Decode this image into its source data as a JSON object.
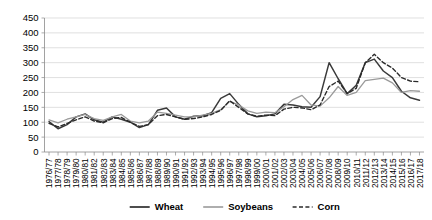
{
  "chart_data": {
    "type": "line",
    "title": "",
    "subtitle": "",
    "xlabel": "",
    "ylabel": "",
    "ylim": [
      0,
      450
    ],
    "ytick_step": 50,
    "grid": true,
    "legend_position": "bottom",
    "yticks": [
      "0",
      "50",
      "100",
      "150",
      "200",
      "250",
      "300",
      "350",
      "400",
      "450"
    ],
    "categories": [
      "1976/77",
      "1977/78",
      "1978/79",
      "1979/80",
      "1980/81",
      "1981/82",
      "1982/83",
      "1983/84",
      "1984/85",
      "1985/86",
      "1986/87",
      "1987/88",
      "1988/89",
      "1989/90",
      "1990/91",
      "1991/92",
      "1992/93",
      "1993/94",
      "1994/95",
      "1995/96",
      "1996/97",
      "1997/98",
      "1998/99",
      "1999/00",
      "2000/01",
      "2001/02",
      "2002/03",
      "2003/04",
      "2004/05",
      "2005/06",
      "2006/07",
      "2007/08",
      "2008/09",
      "2009/10",
      "2010/11",
      "2011/12",
      "2012/13",
      "2013/14",
      "2014/15",
      "2015/16",
      "2016/17",
      "2017/18"
    ],
    "series": [
      {
        "name": "Wheat",
        "color": "#3a3a3a",
        "style": "solid",
        "width": 1.5,
        "values": [
          102,
          78,
          92,
          118,
          128,
          108,
          100,
          118,
          110,
          100,
          82,
          92,
          140,
          148,
          118,
          110,
          120,
          122,
          132,
          180,
          196,
          160,
          128,
          118,
          122,
          128,
          160,
          158,
          152,
          150,
          186,
          300,
          246,
          196,
          224,
          300,
          312,
          272,
          250,
          204,
          182,
          174
        ]
      },
      {
        "name": "Soybeans",
        "color": "#9a9a9a",
        "style": "solid",
        "width": 1.3,
        "values": [
          108,
          98,
          110,
          118,
          126,
          112,
          106,
          118,
          126,
          104,
          98,
          104,
          134,
          130,
          124,
          118,
          118,
          124,
          130,
          142,
          170,
          158,
          138,
          130,
          134,
          132,
          152,
          176,
          190,
          158,
          154,
          182,
          220,
          190,
          200,
          240,
          244,
          248,
          232,
          200,
          206,
          204
        ]
      },
      {
        "name": "Corn",
        "color": "#2a2a2a",
        "style": "dashed",
        "width": 1.4,
        "values": [
          96,
          84,
          96,
          108,
          118,
          104,
          98,
          112,
          116,
          100,
          86,
          92,
          122,
          126,
          118,
          110,
          112,
          118,
          126,
          140,
          172,
          150,
          128,
          120,
          124,
          122,
          144,
          150,
          148,
          142,
          158,
          220,
          238,
          196,
          214,
          300,
          328,
          300,
          282,
          250,
          238,
          236
        ]
      }
    ]
  },
  "legend": {
    "items": [
      {
        "label": "Wheat"
      },
      {
        "label": "Soybeans"
      },
      {
        "label": "Corn"
      }
    ]
  }
}
